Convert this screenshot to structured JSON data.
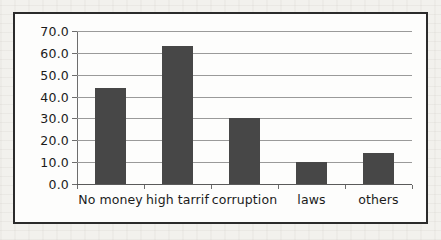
{
  "chart_data": {
    "type": "bar",
    "title": "",
    "subtitle": "",
    "xlabel": "",
    "ylabel": "",
    "categories": [
      "No money",
      "high tarrif",
      "corruption",
      "laws",
      "others"
    ],
    "values": [
      44.0,
      63.0,
      30.0,
      10.0,
      14.0
    ],
    "ylim": [
      0.0,
      70.0
    ],
    "ytick_step": 10.0,
    "ytick_labels": [
      "0.0",
      "10.0",
      "20.0",
      "30.0",
      "40.0",
      "50.0",
      "60.0",
      "70.0"
    ],
    "ytick_values": [
      0.0,
      10.0,
      20.0,
      30.0,
      40.0,
      50.0,
      60.0,
      70.0
    ],
    "grid": "horizontal",
    "legend": "none",
    "series": [
      {
        "name": "",
        "values": [
          44.0,
          63.0,
          30.0,
          10.0,
          14.0
        ],
        "color": "#474747"
      }
    ],
    "annotations": []
  },
  "figure": {
    "border_color": "#2b2b2b",
    "plot_background": "#fdfdfc",
    "page_background": "#f2f1ed",
    "gridline_color": "#9a9a9a",
    "bar_color": "#474747"
  }
}
